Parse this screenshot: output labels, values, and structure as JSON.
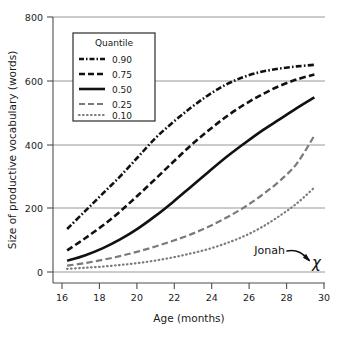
{
  "chart_data": {
    "type": "line",
    "title": "",
    "xlabel": "Age (months)",
    "ylabel": "Size of productive vocabulary (words)",
    "xlim": [
      15.2,
      30.6
    ],
    "ylim": [
      0,
      800
    ],
    "xticks": [
      16,
      18,
      20,
      22,
      24,
      26,
      28,
      30
    ],
    "yticks": [
      0,
      200,
      400,
      600,
      800
    ],
    "grid": "horizontal",
    "legend_position": "upper-left-inside",
    "legend_title": "Quantile",
    "x": [
      16,
      17,
      18,
      19,
      20,
      21,
      22,
      23,
      24,
      25,
      26,
      27,
      28,
      29,
      30
    ],
    "series": [
      {
        "name": "0.90",
        "style": "dash-dot",
        "color": "#111111",
        "values": [
          135,
          190,
          245,
          300,
          360,
          420,
          470,
          515,
          555,
          588,
          612,
          628,
          638,
          645,
          650
        ]
      },
      {
        "name": "0.75",
        "style": "dashed",
        "color": "#111111",
        "values": [
          68,
          105,
          145,
          190,
          240,
          292,
          345,
          397,
          444,
          487,
          524,
          556,
          583,
          604,
          620
        ]
      },
      {
        "name": "0.50",
        "style": "solid",
        "color": "#111111",
        "values": [
          35,
          52,
          74,
          102,
          136,
          176,
          220,
          267,
          314,
          360,
          402,
          442,
          478,
          514,
          548
        ]
      },
      {
        "name": "0.25",
        "style": "dashed-grey",
        "color": "#7a7a7a",
        "values": [
          20,
          28,
          38,
          50,
          64,
          80,
          98,
          118,
          142,
          170,
          202,
          240,
          284,
          340,
          428
        ]
      },
      {
        "name": "0.10",
        "style": "dotted",
        "color": "#7a7a7a",
        "values": [
          10,
          13,
          17,
          22,
          28,
          36,
          46,
          58,
          72,
          90,
          112,
          140,
          175,
          215,
          265
        ]
      }
    ],
    "annotations": [
      {
        "name": "jonah",
        "label": "Jonah",
        "marker": "X",
        "marker_x": 30,
        "marker_y": 12,
        "has_arrow": true
      }
    ]
  },
  "legend": {
    "title": "Quantile",
    "entries": [
      {
        "label": "0.90"
      },
      {
        "label": "0.75"
      },
      {
        "label": "0.50"
      },
      {
        "label": "0.25"
      },
      {
        "label": "0.10"
      }
    ]
  },
  "axes": {
    "x_title": "Age (months)",
    "y_title": "Size of productive vocabulary (words)",
    "x_tick_labels": [
      "16",
      "18",
      "20",
      "22",
      "24",
      "26",
      "28",
      "30"
    ],
    "y_tick_labels": [
      "0",
      "200",
      "400",
      "600",
      "800"
    ]
  },
  "annotation": {
    "jonah_label": "Jonah",
    "jonah_marker": "χ"
  },
  "colors": {
    "ink": "#111111",
    "grey_series": "#7a7a7a",
    "gridline": "#8d8d8d",
    "axis": "#4d4d4d",
    "background": "#ffffff"
  }
}
